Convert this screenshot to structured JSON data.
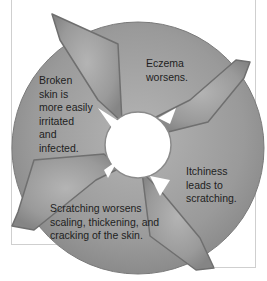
{
  "diagram": {
    "type": "cycle",
    "colors": {
      "arrow_fill": "#9a9a9a",
      "arrow_edge": "#6f6f6f",
      "text": "#1e1e1e",
      "background": "#ffffff",
      "frame": "#cfcfcf"
    },
    "steps": [
      {
        "id": "top-right",
        "text_lines": [
          "Eczema",
          "worsens."
        ]
      },
      {
        "id": "bottom-right",
        "text_lines": [
          "Itchiness",
          "leads to",
          "scratching."
        ]
      },
      {
        "id": "bottom-left",
        "text_lines": [
          "Scratching worsens",
          "scaling, thickening, and",
          "cracking of the skin."
        ]
      },
      {
        "id": "top-left",
        "text_lines": [
          "Broken",
          "skin is",
          "more easily",
          "irritated",
          "and",
          "infected."
        ]
      }
    ]
  }
}
